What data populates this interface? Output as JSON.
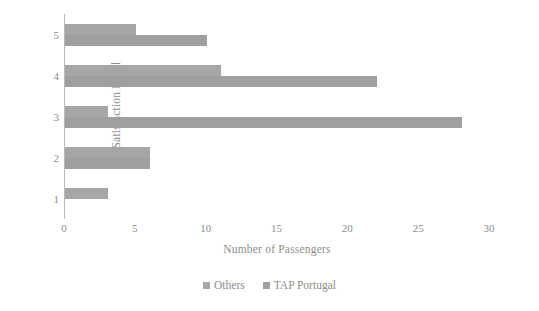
{
  "chart_data": {
    "type": "bar",
    "orientation": "horizontal",
    "title": "",
    "xlabel": "Number of Passengers",
    "ylabel": "Satisfaction Level",
    "categories": [
      "1",
      "2",
      "3",
      "4",
      "5"
    ],
    "series": [
      {
        "name": "Others",
        "color": "#a6a6a6",
        "values": [
          3,
          6,
          3,
          11,
          5
        ]
      },
      {
        "name": "TAP Portugal",
        "color": "#9f9f9f",
        "values": [
          0,
          6,
          28,
          22,
          10
        ]
      }
    ],
    "xlim": [
      0,
      30
    ],
    "xticks": [
      0,
      5,
      10,
      15,
      20,
      25,
      30
    ],
    "xtick_labels": [
      "0",
      "5",
      "10",
      "15",
      "20",
      "25",
      "30"
    ],
    "grid": false,
    "legend_position": "bottom"
  },
  "legend": {
    "items": [
      {
        "label": "Others",
        "color": "#a6a6a6"
      },
      {
        "label": "TAP Portugal",
        "color": "#9f9f9f"
      }
    ]
  }
}
